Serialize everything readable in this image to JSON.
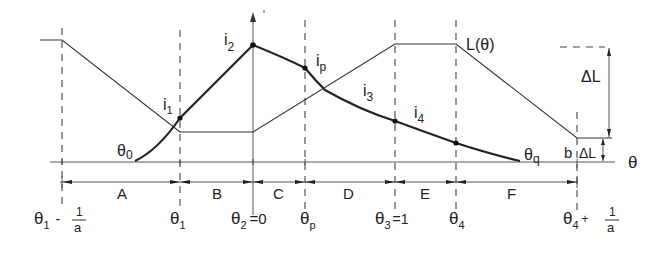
{
  "diagram": {
    "curve_labels": {
      "L": "L(θ)",
      "i1": "i",
      "i1_sub": "1",
      "i2": "i",
      "i2_sub": "2",
      "ip": "i",
      "ip_sub": "p",
      "i3": "i",
      "i3_sub": "3",
      "i4": "i",
      "i4_sub": "4",
      "theta0": "θ",
      "theta0_sub": "0",
      "thetaq": "θ",
      "thetaq_sub": "q"
    },
    "axis_label": "θ",
    "delta_labels": {
      "upper": "ΔL",
      "lower_prefix": "b",
      "lower": "ΔL"
    },
    "regions": [
      "A",
      "B",
      "C",
      "D",
      "E",
      "F"
    ],
    "ticks": {
      "t0": {
        "main": "θ",
        "sub": "1",
        "suffix": "-",
        "num": "1",
        "den": "a"
      },
      "t1": {
        "main": "θ",
        "sub": "1"
      },
      "t2": {
        "main": "θ",
        "sub": "2",
        "suffix": "=0"
      },
      "tp": {
        "main": "θ",
        "sub": "p"
      },
      "t3": {
        "main": "θ",
        "sub": "3",
        "suffix": "=1"
      },
      "t4": {
        "main": "θ",
        "sub": "4"
      },
      "t5": {
        "main": "θ",
        "sub": "4",
        "suffix": "+",
        "num": "1",
        "den": "a"
      }
    }
  }
}
